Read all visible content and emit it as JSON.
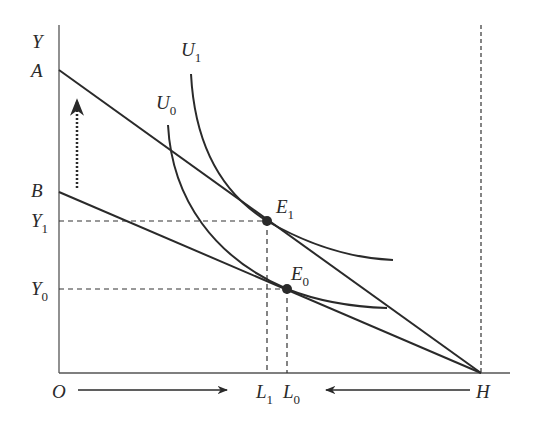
{
  "diagram": {
    "type": "labor-leisure indifference curve diagram",
    "axes": {
      "y_label": "Y",
      "origin_label": "O",
      "h_label": "H"
    },
    "intercepts": {
      "upper_budget_label": "A",
      "lower_budget_label": "B"
    },
    "levels": {
      "y1": {
        "main": "Y",
        "sub": "1"
      },
      "y0": {
        "main": "Y",
        "sub": "0"
      },
      "l1": {
        "main": "L",
        "sub": "1"
      },
      "l0": {
        "main": "L",
        "sub": "0"
      }
    },
    "curves": {
      "u1": {
        "main": "U",
        "sub": "1"
      },
      "u0": {
        "main": "U",
        "sub": "0"
      }
    },
    "points": {
      "e1": {
        "main": "E",
        "sub": "1"
      },
      "e0": {
        "main": "E",
        "sub": "0"
      }
    },
    "arrows": {
      "vertical_shift": "dotted upward arrow (budget line shift from B to A)",
      "origin_to_right": "arrow from O pointing right",
      "h_to_left": "arrow from H pointing left"
    },
    "colors": {
      "ink": "#2a2a2a",
      "background": "#ffffff"
    }
  }
}
